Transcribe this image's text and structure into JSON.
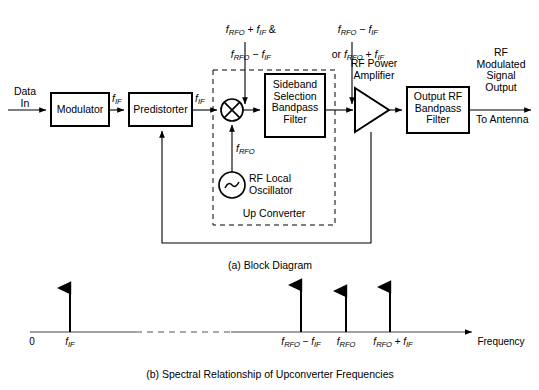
{
  "figure": {
    "blocks": [
      {
        "id": "modulator",
        "label": "Modulator",
        "x": 50,
        "y": 92,
        "w": 60,
        "h": 35
      },
      {
        "id": "predistorter",
        "label": "Predistorter",
        "x": 128,
        "y": 92,
        "w": 65,
        "h": 35
      },
      {
        "id": "sideband-filter",
        "label": "Sideband\nSelection\nBandpass\nFilter",
        "x": 264,
        "y": 73,
        "w": 62,
        "h": 65
      },
      {
        "id": "output-filter",
        "label": "Output RF\nBandpass\nFilter",
        "x": 406,
        "y": 86,
        "w": 64,
        "h": 48
      }
    ],
    "mixer": {
      "id": "mixer",
      "cx": 232,
      "cy": 110,
      "r": 11
    },
    "oscillator": {
      "id": "rf-local-oscillator",
      "cx": 232,
      "cy": 185,
      "r": 13,
      "label": "RF Local\nOscillator"
    },
    "amplifier": {
      "id": "rf-power-amplifier",
      "label": "RF Power\nAmplifier"
    },
    "upconverter_box": {
      "label": "Up Converter",
      "x": 213,
      "y": 70,
      "w": 122,
      "h": 155
    },
    "signal_labels": {
      "data_in": "Data\nIn",
      "f_if_1": "f_IF",
      "f_if_2": "f_IF",
      "f_rfo": "f_RFO",
      "output": "RF\nModulated\nSignal\nOutput",
      "to_antenna": "To Antenna"
    },
    "top_annotations": [
      {
        "id": "mixer-output-freqs",
        "line1": "f_RFO + f_IF &",
        "line2": "f_RFO - f_IF",
        "x": 245,
        "y": 13
      },
      {
        "id": "filter-output-freqs",
        "line1": "f_RFO - f_IF",
        "line2": "or f_RFO + f_IF",
        "x": 352,
        "y": 13
      }
    ],
    "caption_a": "(a) Block Diagram",
    "caption_b": "(b) Spectral Relationship of Upconverter Frequencies"
  },
  "chart_data": {
    "type": "bar",
    "title": "(b) Spectral Relationship of Upconverter Frequencies",
    "xlabel": "Frequency",
    "ylabel": "",
    "grid": false,
    "legend": "none",
    "origin_label": "0",
    "axis_break": true,
    "categories": [
      "f_IF",
      "f_RFO - f_IF",
      "f_RFO",
      "f_RFO + f_IF"
    ],
    "tick_labels": [
      "f_IF",
      "f_RFO − f_IF",
      "f_RFO",
      "f_RFO + f_IF"
    ],
    "x_pixels": [
      70,
      301,
      346,
      390
    ],
    "values": [
      1.0,
      1.05,
      0.92,
      1.0
    ],
    "bar_heights_px": [
      52,
      55,
      48,
      52
    ],
    "axis_y_px": 332,
    "axis_x_start_px": 30,
    "axis_x_end_px": 478,
    "dash_start_px": 136,
    "dash_end_px": 231
  },
  "colors": {
    "ink": "#000000",
    "background": "#ffffff",
    "thin_line": "#3a3a3a"
  }
}
